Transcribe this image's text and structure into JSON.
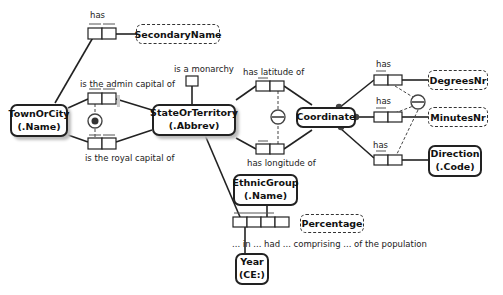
{
  "diagram": {
    "type": "ORM fact model",
    "entities": {
      "town": {
        "line1": "TownOrCity",
        "line2": "(.Name)"
      },
      "state": {
        "line1": "StateOrTerritory",
        "line2": "(.Abbrev)"
      },
      "coordinate": {
        "line1": "Coordinate"
      },
      "ethnic": {
        "line1": "EthnicGroup",
        "line2": "(.Name)"
      },
      "year": {
        "line1": "Year",
        "line2": "(CE:)"
      },
      "direction": {
        "line1": "Direction",
        "line2": "(.Code)"
      }
    },
    "value_types": {
      "secondary_name": "SecondaryName",
      "degrees": "DegreesNr",
      "minutes": "MinutesNr",
      "percentage": "Percentage"
    },
    "fact_labels": {
      "has_secondary": "has",
      "admin_capital": "is the admin capital of",
      "royal_capital": "is the royal capital of",
      "monarchy": "is a monarchy",
      "latitude": "has latitude of",
      "longitude": "has longitude of",
      "has_degrees": "has",
      "has_minutes": "has",
      "has_direction": "has",
      "ethnic_reading": "... in ... had ... comprising ... of the population"
    },
    "colors": {
      "line": "#222222",
      "shadow": "#bbbbbb"
    }
  }
}
